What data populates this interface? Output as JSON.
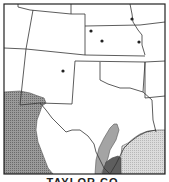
{
  "map": {
    "type": "species range map",
    "region": "Texas and surrounding states",
    "colors": {
      "background": "#ffffff",
      "border": "#333333",
      "range_dark": "#8a8a8a",
      "range_medium": "#a8a8a8",
      "range_light": "#d4d4d4",
      "range_darkest": "#5a5a5a",
      "record_dot": "#222222"
    },
    "record_dots": [
      {
        "x": 132,
        "y": 19
      },
      {
        "x": 91,
        "y": 31
      },
      {
        "x": 102,
        "y": 41
      },
      {
        "x": 139,
        "y": 42
      },
      {
        "x": 63,
        "y": 71
      }
    ]
  },
  "caption": {
    "text": "TAYLOR CO."
  }
}
